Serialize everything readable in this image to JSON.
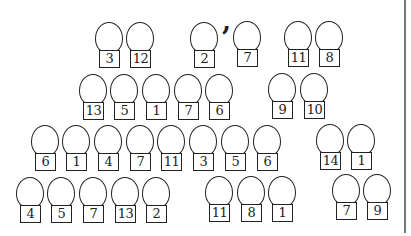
{
  "separator": ",",
  "groups": [
    {
      "row": 1,
      "figures": [
        {
          "label": "3",
          "x": 95,
          "y": 22
        },
        {
          "label": "12",
          "x": 126,
          "y": 22
        }
      ]
    },
    {
      "row": 1,
      "figures": [
        {
          "label": "2",
          "x": 190,
          "y": 22
        },
        {
          "label": "7",
          "x": 233,
          "y": 21
        }
      ]
    },
    {
      "row": 1,
      "figures": [
        {
          "label": "11",
          "x": 284,
          "y": 21
        },
        {
          "label": "8",
          "x": 315,
          "y": 21
        }
      ]
    },
    {
      "row": 2,
      "figures": [
        {
          "label": "13",
          "x": 79,
          "y": 74
        },
        {
          "label": "5",
          "x": 110,
          "y": 74
        },
        {
          "label": "1",
          "x": 142,
          "y": 74
        },
        {
          "label": "7",
          "x": 174,
          "y": 74
        },
        {
          "label": "6",
          "x": 205,
          "y": 74
        }
      ]
    },
    {
      "row": 2,
      "figures": [
        {
          "label": "9",
          "x": 268,
          "y": 73
        },
        {
          "label": "10",
          "x": 300,
          "y": 73
        }
      ]
    },
    {
      "row": 3,
      "figures": [
        {
          "label": "6",
          "x": 31,
          "y": 125
        },
        {
          "label": "1",
          "x": 62,
          "y": 125
        },
        {
          "label": "4",
          "x": 94,
          "y": 125
        },
        {
          "label": "7",
          "x": 126,
          "y": 125
        },
        {
          "label": "11",
          "x": 157,
          "y": 125
        },
        {
          "label": "3",
          "x": 189,
          "y": 125
        },
        {
          "label": "5",
          "x": 221,
          "y": 125
        },
        {
          "label": "6",
          "x": 253,
          "y": 125
        }
      ]
    },
    {
      "row": 3,
      "figures": [
        {
          "label": "14",
          "x": 316,
          "y": 124
        },
        {
          "label": "1",
          "x": 347,
          "y": 124
        }
      ]
    },
    {
      "row": 4,
      "figures": [
        {
          "label": "4",
          "x": 16,
          "y": 177
        },
        {
          "label": "5",
          "x": 47,
          "y": 177
        },
        {
          "label": "7",
          "x": 79,
          "y": 177
        },
        {
          "label": "13",
          "x": 111,
          "y": 177
        },
        {
          "label": "2",
          "x": 142,
          "y": 177
        }
      ]
    },
    {
      "row": 4,
      "figures": [
        {
          "label": "11",
          "x": 205,
          "y": 176
        },
        {
          "label": "8",
          "x": 237,
          "y": 176
        },
        {
          "label": "1",
          "x": 268,
          "y": 176
        }
      ]
    },
    {
      "row": 4,
      "figures": [
        {
          "label": "7",
          "x": 332,
          "y": 174
        },
        {
          "label": "9",
          "x": 363,
          "y": 174
        }
      ]
    }
  ]
}
